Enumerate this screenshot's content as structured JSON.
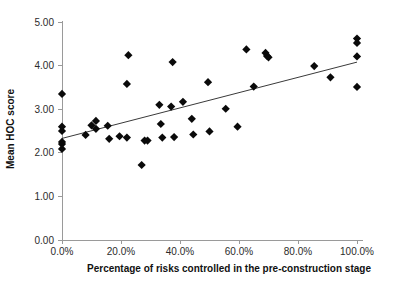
{
  "chart_data": {
    "type": "scatter",
    "title": "",
    "xlabel": "Percentage of risks controlled in the pre-construction stage",
    "ylabel": "Mean HOC score",
    "xlim": [
      0,
      100
    ],
    "ylim": [
      0,
      5
    ],
    "grid": false,
    "legend": "none",
    "x_tick_labels": [
      "0.0%",
      "20.0%",
      "40.0%",
      "60.0%",
      "80.0%",
      "100.0%"
    ],
    "x_tick_values": [
      0,
      20,
      40,
      60,
      80,
      100
    ],
    "y_tick_labels": [
      "0.00",
      "1.00",
      "2.00",
      "3.00",
      "4.00",
      "5.00"
    ],
    "y_tick_values": [
      0,
      1,
      2,
      3,
      4,
      5
    ],
    "marker": "diamond",
    "marker_color": "#0a0a0a",
    "points": [
      [
        0.0,
        3.35
      ],
      [
        0.0,
        2.6
      ],
      [
        0.0,
        2.5
      ],
      [
        0.0,
        2.25
      ],
      [
        0.0,
        2.2
      ],
      [
        0.0,
        2.09
      ],
      [
        8.0,
        2.41
      ],
      [
        10.0,
        2.63
      ],
      [
        11.5,
        2.73
      ],
      [
        11.5,
        2.55
      ],
      [
        15.5,
        2.62
      ],
      [
        16.0,
        2.32
      ],
      [
        19.5,
        2.38
      ],
      [
        22.0,
        3.58
      ],
      [
        22.0,
        2.35
      ],
      [
        22.5,
        4.24
      ],
      [
        27.0,
        1.72
      ],
      [
        28.0,
        2.28
      ],
      [
        29.0,
        2.28
      ],
      [
        33.0,
        3.1
      ],
      [
        33.5,
        2.66
      ],
      [
        34.0,
        2.35
      ],
      [
        37.0,
        3.06
      ],
      [
        37.5,
        4.08
      ],
      [
        38.0,
        2.36
      ],
      [
        41.0,
        3.17
      ],
      [
        44.0,
        2.78
      ],
      [
        44.5,
        2.42
      ],
      [
        49.5,
        3.62
      ],
      [
        50.0,
        2.49
      ],
      [
        55.5,
        3.01
      ],
      [
        59.5,
        2.6
      ],
      [
        62.5,
        4.37
      ],
      [
        65.0,
        3.52
      ],
      [
        69.0,
        4.29
      ],
      [
        69.5,
        4.22
      ],
      [
        70.0,
        4.19
      ],
      [
        85.5,
        3.99
      ],
      [
        91.0,
        3.73
      ],
      [
        100.0,
        4.62
      ],
      [
        100.0,
        4.52
      ],
      [
        100.0,
        4.21
      ],
      [
        100.0,
        3.51
      ]
    ],
    "trendline": {
      "visible": true,
      "x_start": 0,
      "y_start": 2.33,
      "x_end": 100,
      "y_end": 4.08,
      "color": "#3a3a3a"
    }
  },
  "axis": {
    "x_title": "Percentage of risks controlled in the pre-construction stage",
    "y_title": "Mean HOC score"
  }
}
